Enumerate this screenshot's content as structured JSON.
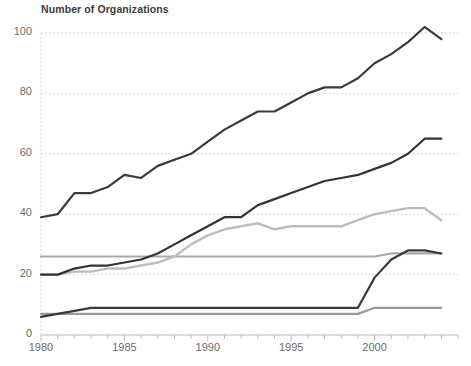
{
  "chart_data": {
    "type": "line",
    "title": "Number of Organizations",
    "xlabel": "",
    "ylabel": "",
    "xlim": [
      1980,
      2005
    ],
    "ylim": [
      0,
      105
    ],
    "yticks": [
      0,
      20,
      40,
      60,
      80,
      100
    ],
    "xticks": [
      1980,
      1985,
      1990,
      1995,
      2000
    ],
    "xtick_minor_step": 1,
    "grid": "horizontal-dotted",
    "legend": "none",
    "x": [
      1980,
      1981,
      1982,
      1983,
      1984,
      1985,
      1986,
      1987,
      1988,
      1989,
      1990,
      1991,
      1992,
      1993,
      1994,
      1995,
      1996,
      1997,
      1998,
      1999,
      2000,
      2001,
      2002,
      2003,
      2004
    ],
    "series": [
      {
        "name": "series-1-top-dark",
        "color": "#3a3a3a",
        "width": 2.2,
        "values": [
          39,
          40,
          47,
          47,
          49,
          53,
          52,
          56,
          58,
          60,
          64,
          68,
          71,
          74,
          74,
          77,
          80,
          82,
          82,
          85,
          90,
          93,
          97,
          102,
          98
        ]
      },
      {
        "name": "series-2-dark",
        "color": "#333333",
        "width": 2.2,
        "values": [
          20,
          20,
          22,
          23,
          23,
          24,
          25,
          27,
          30,
          33,
          36,
          39,
          39,
          43,
          45,
          47,
          49,
          51,
          52,
          53,
          55,
          57,
          60,
          65,
          65
        ]
      },
      {
        "name": "series-3-light-gray",
        "color": "#bdbdbd",
        "width": 2.4,
        "values": [
          20,
          20,
          21,
          21,
          22,
          22,
          23,
          24,
          26,
          30,
          33,
          35,
          36,
          37,
          35,
          36,
          36,
          36,
          36,
          38,
          40,
          41,
          42,
          42,
          38
        ]
      },
      {
        "name": "series-4-mid-gray-flat",
        "color": "#a9a9a9",
        "width": 2.2,
        "values": [
          26,
          26,
          26,
          26,
          26,
          26,
          26,
          26,
          26,
          26,
          26,
          26,
          26,
          26,
          26,
          26,
          26,
          26,
          26,
          26,
          26,
          27,
          27,
          27,
          27
        ]
      },
      {
        "name": "series-5-lower-dark",
        "color": "#3a3a3a",
        "width": 2.2,
        "values": [
          6,
          7,
          8,
          9,
          9,
          9,
          9,
          9,
          9,
          9,
          9,
          9,
          9,
          9,
          9,
          9,
          9,
          9,
          9,
          9,
          19,
          25,
          28,
          28,
          27
        ]
      },
      {
        "name": "series-6-lower-light",
        "color": "#9a9a9a",
        "width": 2.2,
        "values": [
          7,
          7,
          7,
          7,
          7,
          7,
          7,
          7,
          7,
          7,
          7,
          7,
          7,
          7,
          7,
          7,
          7,
          7,
          7,
          7,
          9,
          9,
          9,
          9,
          9
        ]
      }
    ]
  },
  "axes": {
    "ytick_labels": [
      "0",
      "20",
      "40",
      "60",
      "80",
      "100"
    ],
    "xtick_labels": [
      "1980",
      "1985",
      "1990",
      "1995",
      "2000"
    ]
  },
  "colors": {
    "grid": "#cfcfcf",
    "axis": "#bbbbbb",
    "text": "#6b6b6b",
    "title": "#3b3b3b",
    "background": "#ffffff"
  }
}
